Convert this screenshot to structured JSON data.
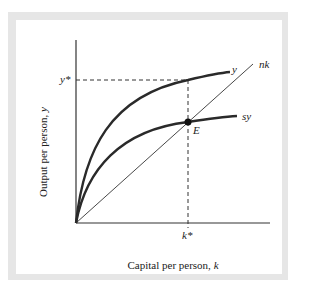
{
  "diagram": {
    "type": "solow-growth-model",
    "x_axis_label": "Capital per person, ",
    "x_axis_var": "k",
    "y_axis_label": "Output per person, ",
    "y_axis_var": "y",
    "y_star_label": "y*",
    "k_star_label": "k*",
    "equilibrium_label": "E",
    "curves": [
      {
        "name": "output",
        "label": "y"
      },
      {
        "name": "savings",
        "label": "sy"
      },
      {
        "name": "break-even",
        "label": "nk"
      }
    ],
    "colors": {
      "curve": "#2a2a2a",
      "frame": "#e6e6e6",
      "background": "#ffffff"
    }
  }
}
